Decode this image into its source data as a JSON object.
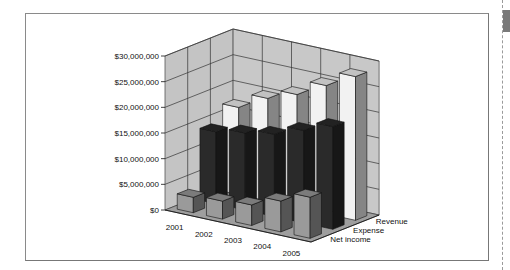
{
  "chart_data": {
    "type": "bar",
    "subtype": "3d-column",
    "title": "",
    "xlabel": "",
    "ylabel": "",
    "categories": [
      "2001",
      "2002",
      "2003",
      "2004",
      "2005"
    ],
    "series": [
      {
        "name": "Net income",
        "values": [
          3000000,
          3500000,
          4000000,
          6000000,
          8000000
        ],
        "color": "#9a9a9a"
      },
      {
        "name": "Expense",
        "values": [
          14000000,
          15000000,
          16000000,
          18000000,
          20000000
        ],
        "color": "#2a2a2a"
      },
      {
        "name": "Revenue",
        "values": [
          17000000,
          20000000,
          22000000,
          25000000,
          28000000
        ],
        "color": "#f2f2f2"
      }
    ],
    "y_ticks": [
      "$0",
      "$5,000,000",
      "$10,000,000",
      "$15,000,000",
      "$20,000,000",
      "$25,000,000",
      "$30,000,000"
    ],
    "ylim": [
      0,
      30000000
    ],
    "grid": true,
    "legend_position": "depth-axis labels (right)"
  }
}
